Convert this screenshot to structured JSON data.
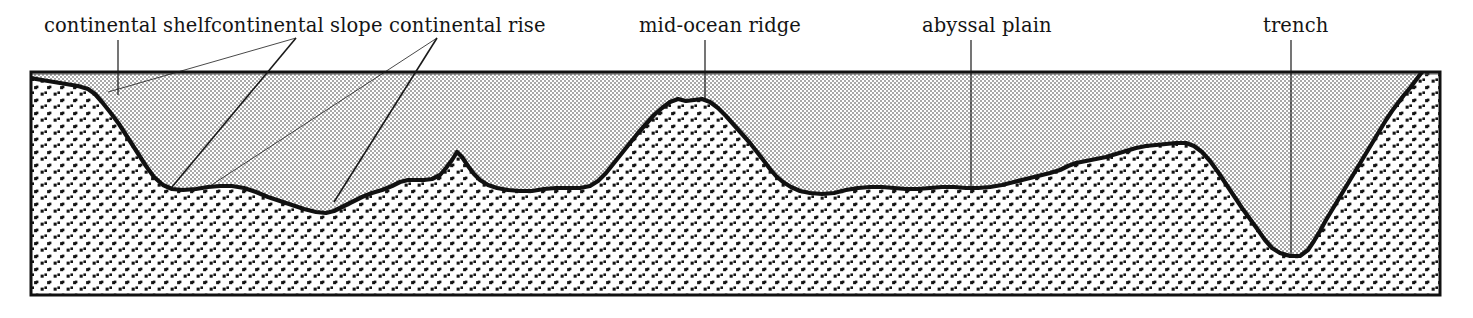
{
  "diagram": {
    "colors": {
      "frame": "#111111",
      "seafloor_line": "#111111",
      "water_fill": "#d3d3d3",
      "seabed_fill": "#ffffff",
      "stipple_dot": "#141414",
      "label_text": "#141414",
      "leader_line": "#1a1a1a",
      "background": "#ffffff"
    },
    "frame": {
      "x": 31,
      "y": 72,
      "width": 1409,
      "height": 223
    },
    "sea_level_y": 74,
    "labels": [
      {
        "id": "continental-shelf",
        "text": "continental shelf",
        "text_x": 44,
        "text_y": 32,
        "anchor": "start",
        "leaders": [
          {
            "x1": 118,
            "y1": 40,
            "x2": 118,
            "y2": 95,
            "weight": 1.2
          }
        ]
      },
      {
        "id": "continental-slope",
        "text": "continental slope",
        "text_x": 211,
        "text_y": 32,
        "anchor": "start",
        "leaders": [
          {
            "x1": 296,
            "y1": 38,
            "x2": 108,
            "y2": 92,
            "weight": 0.8
          },
          {
            "x1": 296,
            "y1": 38,
            "x2": 172,
            "y2": 187,
            "weight": 1.6
          }
        ]
      },
      {
        "id": "continental-rise",
        "text": "continental rise",
        "text_x": 389,
        "text_y": 32,
        "anchor": "start",
        "leaders": [
          {
            "x1": 437,
            "y1": 38,
            "x2": 210,
            "y2": 186,
            "weight": 0.8
          },
          {
            "x1": 437,
            "y1": 38,
            "x2": 334,
            "y2": 202,
            "weight": 1.6
          }
        ]
      },
      {
        "id": "mid-ocean-ridge",
        "text": "mid-ocean ridge",
        "text_x": 639,
        "text_y": 32,
        "anchor": "start",
        "leaders": [
          {
            "x1": 705,
            "y1": 40,
            "x2": 705,
            "y2": 101,
            "weight": 1.2
          }
        ]
      },
      {
        "id": "abyssal-plain",
        "text": "abyssal plain",
        "text_x": 922,
        "text_y": 32,
        "anchor": "start",
        "leaders": [
          {
            "x1": 971,
            "y1": 40,
            "x2": 971,
            "y2": 188,
            "weight": 1.2
          }
        ]
      },
      {
        "id": "trench",
        "text": "trench",
        "text_x": 1263,
        "text_y": 32,
        "anchor": "start",
        "leaders": [
          {
            "x1": 1291,
            "y1": 40,
            "x2": 1291,
            "y2": 254,
            "weight": 1.2
          }
        ]
      }
    ],
    "seafloor_profile": "M 31,78 L 42,80 L 54,82 L 66,84 L 78,86 L 88,89 L 95,94 L 102,102 L 110,112 L 119,124 L 128,138 L 137,152 L 146,166 L 154,177 L 163,185 L 172,189 L 183,190 L 196,189 L 208,187 L 220,186 L 232,186 L 244,188 L 256,192 L 268,197 L 280,201 L 292,205 L 304,209 L 316,212 L 326,213 L 334,211 L 342,207 L 352,202 L 362,197 L 372,193 L 382,190 L 392,186 L 400,182 L 408,180 L 416,180 L 424,180 L 432,179 L 440,175 L 446,168 L 452,160 L 457,152 L 462,157 L 468,166 L 474,174 L 480,180 L 488,185 L 497,188 L 508,190 L 520,191 L 532,191 L 544,189 L 556,188 L 568,188 L 580,188 L 590,186 L 598,181 L 606,173 L 614,163 L 622,153 L 630,143 L 638,133 L 646,124 L 654,115 L 662,108 L 670,102 L 678,99 L 686,101 L 694,100 L 702,99 L 710,102 L 718,108 L 726,116 L 734,125 L 742,134 L 750,143 L 757,152 L 764,161 L 770,169 L 776,176 L 783,182 L 791,187 L 800,191 L 810,193 L 822,194 L 834,193 L 846,190 L 858,188 L 870,187 L 882,187 L 894,188 L 906,189 L 918,189 L 930,188 L 942,187 L 954,187 L 966,188 L 978,188 L 990,187 L 1002,185 L 1014,182 L 1026,179 L 1038,176 L 1050,173 L 1060,170 L 1068,166 L 1076,163 L 1086,161 L 1096,159 L 1106,157 L 1116,154 L 1126,151 L 1136,148 L 1146,146 L 1156,145 L 1166,144 L 1176,143 L 1186,143 L 1194,146 L 1202,152 L 1210,161 L 1218,172 L 1226,184 L 1234,196 L 1242,208 L 1250,219 L 1258,230 L 1265,240 L 1272,248 L 1280,253 L 1290,256 L 1300,256 L 1308,250 L 1314,241 L 1320,231 L 1326,220 L 1332,210 L 1338,200 L 1344,190 L 1350,180 L 1356,170 L 1362,160 L 1368,150 L 1374,140 L 1380,130 L 1386,120 L 1392,111 L 1398,103 L 1404,95 L 1410,88 L 1416,80 L 1422,72 L 1428,66 L 1434,63 L 1440,63"
  }
}
